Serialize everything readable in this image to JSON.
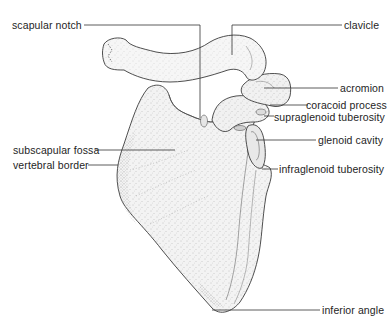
{
  "figure": {
    "labels": {
      "scapular_notch": "scapular notch",
      "clavicle": "clavicle",
      "acromion": "acromion",
      "coracoid_process": "coracoid process",
      "supraglenoid_tuberosity": "supraglenoid tuberosity",
      "glenoid_cavity": "glenoid cavity",
      "subscapular_fossa": "subscapular fossa",
      "vertebral_border": "vertebral border",
      "infraglenoid_tuberosity": "infraglenoid tuberosity",
      "inferior_angle": "inferior angle"
    },
    "colors": {
      "line": "#333333",
      "bone_fill": "#f1f1f1",
      "stipple": "#8a8a8a"
    }
  }
}
